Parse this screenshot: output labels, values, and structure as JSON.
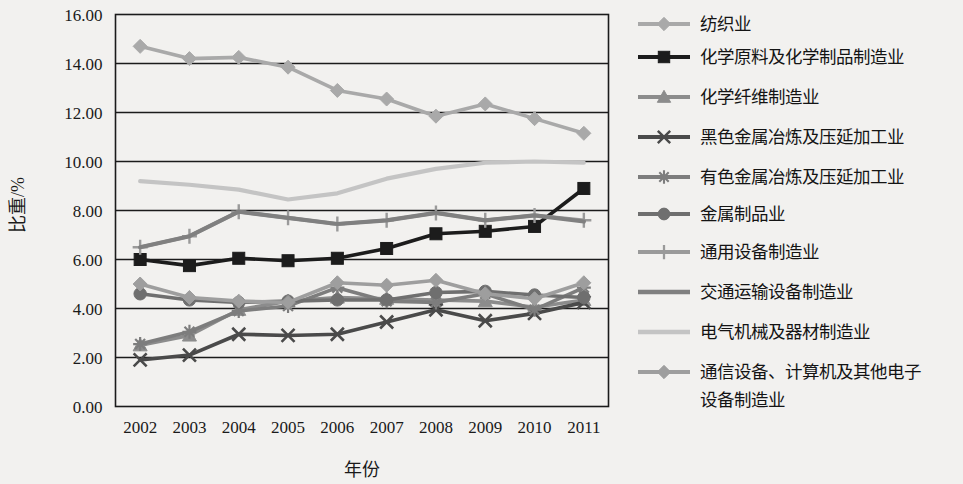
{
  "chart_data": {
    "type": "line",
    "title": "",
    "xlabel": "年份",
    "ylabel": "比重/%",
    "x": [
      "2002",
      "2003",
      "2004",
      "2005",
      "2006",
      "2007",
      "2008",
      "2009",
      "2010",
      "2011"
    ],
    "categories": [
      "2002",
      "2003",
      "2004",
      "2005",
      "2006",
      "2007",
      "2008",
      "2009",
      "2010",
      "2011"
    ],
    "ylim": [
      0,
      16
    ],
    "ytick_labels": [
      "16.00",
      "14.00",
      "12.00",
      "10.00",
      "8.00",
      "6.00",
      "4.00",
      "2.00",
      "0.00"
    ],
    "ytick_values": [
      16,
      14,
      12,
      10,
      8,
      6,
      4,
      2,
      0
    ],
    "grid": "horizontal",
    "legend_position": "right",
    "series": [
      {
        "name": "纺织业",
        "marker": "diamond",
        "color": "#a9a9a9",
        "values": [
          14.7,
          14.2,
          14.25,
          13.85,
          12.9,
          12.55,
          11.85,
          12.35,
          11.75,
          11.15
        ]
      },
      {
        "name": "化学原料及化学制品制造业",
        "marker": "square",
        "color": "#1c1c1c",
        "values": [
          6.0,
          5.75,
          6.05,
          5.95,
          6.05,
          6.45,
          7.05,
          7.15,
          7.35,
          8.9
        ]
      },
      {
        "name": "化学纤维制造业",
        "marker": "triangle",
        "color": "#8c8c8c",
        "values": [
          2.5,
          2.9,
          3.95,
          4.3,
          4.45,
          4.4,
          4.35,
          4.3,
          4.05,
          4.35
        ]
      },
      {
        "name": "黑色金属冶炼及压延加工业",
        "marker": "x",
        "color": "#4a4a4a",
        "values": [
          1.9,
          2.1,
          2.95,
          2.9,
          2.95,
          3.45,
          3.95,
          3.5,
          3.8,
          4.25
        ]
      },
      {
        "name": "有色金属冶炼及压延加工业",
        "marker": "asterisk",
        "color": "#7d7d7d",
        "values": [
          2.55,
          3.05,
          3.9,
          4.1,
          4.85,
          4.3,
          4.25,
          4.6,
          3.95,
          4.85
        ]
      },
      {
        "name": "金属制品业",
        "marker": "circle",
        "color": "#6f6f6f",
        "values": [
          4.6,
          4.35,
          4.25,
          4.3,
          4.35,
          4.35,
          4.65,
          4.7,
          4.55,
          4.45
        ]
      },
      {
        "name": "通用设备制造业",
        "marker": "plus",
        "color": "#9a9a9a",
        "values": [
          6.5,
          6.95,
          7.95,
          7.7,
          7.45,
          7.6,
          7.9,
          7.6,
          7.8,
          7.6
        ]
      },
      {
        "name": "交通运输设备制造业",
        "marker": "none",
        "color": "#808080",
        "values": [
          6.5,
          6.95,
          7.95,
          7.7,
          7.45,
          7.6,
          7.9,
          7.6,
          7.8,
          7.55
        ]
      },
      {
        "name": "电气机械及器材制造业",
        "marker": "none",
        "color": "#c4c4c4",
        "values": [
          9.2,
          9.05,
          8.85,
          8.45,
          8.7,
          9.3,
          9.7,
          9.95,
          10.0,
          9.95
        ]
      },
      {
        "name": "通信设备、计算机及其他电子设备制造业",
        "marker": "diamond",
        "color": "#9e9e9e",
        "values": [
          5.0,
          4.45,
          4.3,
          4.25,
          5.05,
          4.95,
          5.15,
          4.6,
          4.4,
          5.05
        ]
      }
    ]
  },
  "legend": {
    "items": [
      {
        "label": "纺织业"
      },
      {
        "label": "化学原料及化学制品制造业"
      },
      {
        "label": "化学纤维制造业"
      },
      {
        "label": "黑色金属冶炼及压延加工业"
      },
      {
        "label": "有色金属冶炼及压延加工业"
      },
      {
        "label": "金属制品业"
      },
      {
        "label": "通用设备制造业"
      },
      {
        "label": "交通运输设备制造业"
      },
      {
        "label": "电气机械及器材制造业"
      },
      {
        "label": "通信设备、计算机及其他电子",
        "label2": "设备制造业"
      }
    ]
  }
}
